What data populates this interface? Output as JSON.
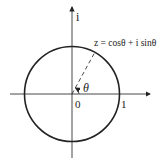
{
  "diagram": {
    "type": "unit-circle-complex-plane",
    "axis_labels": {
      "imaginary": "i"
    },
    "origin_label": "0",
    "unit_label": "1",
    "angle_label": "θ",
    "point_label": "z = cosθ + i sinθ",
    "colors": {
      "stroke": "#222222",
      "background": "#ffffff"
    }
  }
}
